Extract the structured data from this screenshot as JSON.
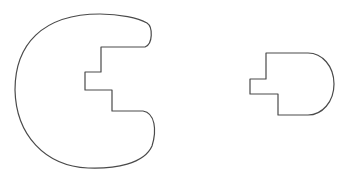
{
  "diagram": {
    "stroke_color": "#4a4a4a",
    "fill_color": "#ffffff",
    "shapes": [
      {
        "name": "large-c-shape",
        "type": "outline"
      },
      {
        "name": "small-d-shape",
        "type": "outline"
      }
    ]
  }
}
